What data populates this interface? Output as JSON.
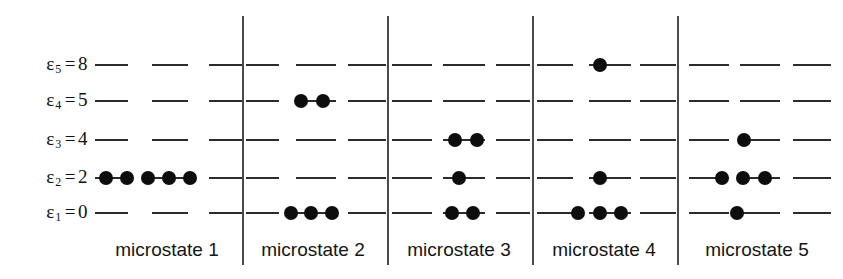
{
  "figure": {
    "width": 843,
    "height": 279,
    "background": "#ffffff",
    "dot_color": "#0d0d0d",
    "line_color": "#2b2b2b",
    "divider_color": "#4a4a4a"
  },
  "energy_levels": [
    {
      "id": "e5",
      "symbol": "ε",
      "index": "5",
      "equals": "=",
      "value": "8",
      "label": "ε₅ = 8",
      "y": 65
    },
    {
      "id": "e4",
      "symbol": "ε",
      "index": "4",
      "equals": "=",
      "value": "5",
      "label": "ε₄ = 5",
      "y": 101
    },
    {
      "id": "e3",
      "symbol": "ε",
      "index": "3",
      "equals": "=",
      "value": "4",
      "label": "ε₃ = 4",
      "y": 140
    },
    {
      "id": "e2",
      "symbol": "ε",
      "index": "2",
      "equals": "=",
      "value": "2",
      "label": "ε₂ = 2",
      "y": 178
    },
    {
      "id": "e1",
      "symbol": "ε",
      "index": "1",
      "equals": "=",
      "value": "0",
      "label": "ε₁ = 0",
      "y": 213
    }
  ],
  "dividers": [
    242,
    387,
    532,
    677
  ],
  "panels": [
    {
      "id": "microstate-1",
      "caption": "microstate 1",
      "caption_x": 167,
      "dash_groups": [
        [
          95,
          33
        ],
        [
          152,
          36
        ],
        [
          209,
          34
        ]
      ],
      "occupancy": {
        "e5": [],
        "e4": [],
        "e3": [],
        "e2": [
          106,
          127,
          148,
          169,
          190
        ],
        "e1": []
      }
    },
    {
      "id": "microstate-2",
      "caption": "microstate 2",
      "caption_x": 313,
      "dash_groups": [
        [
          246,
          33
        ],
        [
          296,
          40
        ],
        [
          348,
          38
        ]
      ],
      "occupancy": {
        "e5": [],
        "e4": [
          301,
          323
        ],
        "e3": [],
        "e2": [],
        "e1": [
          291,
          311,
          332
        ]
      }
    },
    {
      "id": "microstate-3",
      "caption": "microstate 3",
      "caption_x": 459,
      "dash_groups": [
        [
          392,
          40
        ],
        [
          443,
          42
        ],
        [
          496,
          34
        ]
      ],
      "occupancy": {
        "e5": [],
        "e4": [],
        "e3": [
          455,
          477
        ],
        "e2": [
          459
        ],
        "e1": [
          452,
          473
        ]
      }
    },
    {
      "id": "microstate-4",
      "caption": "microstate 4",
      "caption_x": 604,
      "dash_groups": [
        [
          537,
          36
        ],
        [
          589,
          42
        ],
        [
          640,
          36
        ]
      ],
      "occupancy": {
        "e5": [
          600
        ],
        "e4": [],
        "e3": [],
        "e2": [
          600
        ],
        "e1": [
          578,
          600,
          621
        ]
      }
    },
    {
      "id": "microstate-5",
      "caption": "microstate 5",
      "caption_x": 757,
      "dash_groups": [
        [
          689,
          40
        ],
        [
          740,
          40
        ],
        [
          793,
          38
        ]
      ],
      "occupancy": {
        "e5": [],
        "e4": [],
        "e3": [
          744
        ],
        "e2": [
          722,
          743,
          765
        ],
        "e1": [
          737
        ]
      }
    }
  ],
  "chart_data": {
    "type": "diagram",
    "title": "",
    "ylabel": "energy",
    "level_labels": [
      "ε₅ = 8",
      "ε₄ = 5",
      "ε₃ = 4",
      "ε₂ = 2",
      "ε₁ = 0"
    ],
    "level_energies": [
      8,
      5,
      4,
      2,
      0
    ],
    "level_ids": [
      "e5",
      "e4",
      "e3",
      "e2",
      "e1"
    ],
    "categories": [
      "microstate 1",
      "microstate 2",
      "microstate 3",
      "microstate 4",
      "microstate 5"
    ],
    "series": [
      {
        "name": "ε₅ = 8",
        "values": [
          0,
          0,
          0,
          1,
          0
        ]
      },
      {
        "name": "ε₄ = 5",
        "values": [
          0,
          2,
          0,
          0,
          0
        ]
      },
      {
        "name": "ε₃ = 4",
        "values": [
          0,
          0,
          2,
          0,
          1
        ]
      },
      {
        "name": "ε₂ = 2",
        "values": [
          5,
          0,
          1,
          1,
          3
        ]
      },
      {
        "name": "ε₁ = 0",
        "values": [
          0,
          3,
          2,
          3,
          1
        ]
      }
    ],
    "total_particles": [
      5,
      5,
      5,
      5,
      5
    ],
    "total_energy": [
      10,
      10,
      10,
      10,
      10
    ],
    "legend": "off",
    "grid": "off"
  }
}
